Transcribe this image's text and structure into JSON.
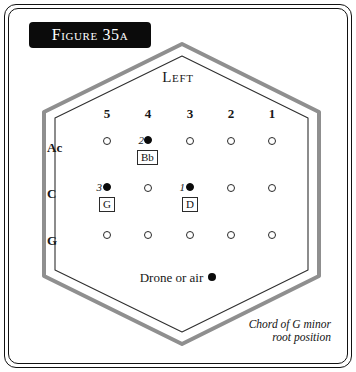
{
  "figure": {
    "title": "Figure 35a",
    "orientation_label": "Left",
    "caption_line1": "Chord of G minor",
    "caption_line2": "root position",
    "drone_label": "Drone or air"
  },
  "colors": {
    "banner_background": "#0b0b0b",
    "banner_text": "#ffffff",
    "hexagon_outer_band": "#8f8f8f",
    "hexagon_inner_line": "#2b2b2b",
    "frame_line": "#111111",
    "dot_filled": "#0a0a0a",
    "dot_open_outline": "#2a2a2a",
    "text": "#171717"
  },
  "grid": {
    "column_headers": [
      "5",
      "4",
      "3",
      "2",
      "1"
    ],
    "row_headers": [
      "Ac",
      "C",
      "G"
    ],
    "column_x": [
      107,
      148,
      190,
      231,
      272
    ],
    "row_y": [
      141,
      188,
      234
    ],
    "rows": [
      {
        "label": "Ac",
        "cells": [
          {
            "column": "5",
            "state": "open"
          },
          {
            "column": "4",
            "state": "filled",
            "finger": "2",
            "note": "Bb"
          },
          {
            "column": "3",
            "state": "open"
          },
          {
            "column": "2",
            "state": "open"
          },
          {
            "column": "1",
            "state": "open"
          }
        ]
      },
      {
        "label": "C",
        "cells": [
          {
            "column": "5",
            "state": "filled",
            "finger": "3",
            "note": "G"
          },
          {
            "column": "4",
            "state": "open"
          },
          {
            "column": "3",
            "state": "filled",
            "finger": "1",
            "note": "D"
          },
          {
            "column": "2",
            "state": "open"
          },
          {
            "column": "1",
            "state": "open"
          }
        ]
      },
      {
        "label": "G",
        "cells": [
          {
            "column": "5",
            "state": "open"
          },
          {
            "column": "4",
            "state": "open"
          },
          {
            "column": "3",
            "state": "open"
          },
          {
            "column": "2",
            "state": "open"
          },
          {
            "column": "1",
            "state": "open"
          }
        ]
      }
    ]
  }
}
